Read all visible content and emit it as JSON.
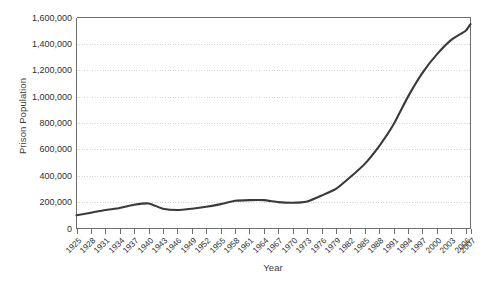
{
  "chart_data": {
    "type": "line",
    "title": "",
    "xlabel": "Year",
    "ylabel": "Prison Population",
    "xlim": [
      1925,
      2007
    ],
    "ylim": [
      0,
      1600000
    ],
    "grid": true,
    "legend": false,
    "legend_position": "none",
    "line_color": "#3a3a3a",
    "grid_color": "#c9c9c9",
    "axis_color": "#6e6e6e",
    "ytick_labels": [
      "0",
      "200,000",
      "400,000",
      "600,000",
      "800,000",
      "1,000,000",
      "1,200,000",
      "1,400,000",
      "1,600,000"
    ],
    "ytick_values": [
      0,
      200000,
      400000,
      600000,
      800000,
      1000000,
      1200000,
      1400000,
      1600000
    ],
    "xtick_labels": [
      "1925",
      "1928",
      "1931",
      "1934",
      "1937",
      "1940",
      "1943",
      "1946",
      "1949",
      "1952",
      "1955",
      "1958",
      "1961",
      "1964",
      "1967",
      "1970",
      "1973",
      "1976",
      "1979",
      "1982",
      "1985",
      "1988",
      "1991",
      "1994",
      "1997",
      "2000",
      "2003",
      "2006",
      "2007"
    ],
    "xtick_values": [
      1925,
      1928,
      1931,
      1934,
      1937,
      1940,
      1943,
      1946,
      1949,
      1952,
      1955,
      1958,
      1961,
      1964,
      1967,
      1970,
      1973,
      1976,
      1979,
      1982,
      1985,
      1988,
      1991,
      1994,
      1997,
      2000,
      2003,
      2006,
      2007
    ],
    "x": [
      1925,
      1928,
      1931,
      1934,
      1937,
      1940,
      1943,
      1946,
      1949,
      1952,
      1955,
      1958,
      1961,
      1964,
      1967,
      1970,
      1973,
      1976,
      1979,
      1982,
      1985,
      1988,
      1991,
      1994,
      1997,
      2000,
      2003,
      2006,
      2007
    ],
    "values": [
      100000,
      120000,
      140000,
      155000,
      180000,
      190000,
      150000,
      140000,
      150000,
      165000,
      185000,
      210000,
      215000,
      215000,
      200000,
      195000,
      205000,
      250000,
      300000,
      390000,
      490000,
      625000,
      790000,
      1000000,
      1180000,
      1320000,
      1430000,
      1500000,
      1550000
    ],
    "series": [
      {
        "name": "Prison Population",
        "values": [
          100000,
          120000,
          140000,
          155000,
          180000,
          190000,
          150000,
          140000,
          150000,
          165000,
          185000,
          210000,
          215000,
          215000,
          200000,
          195000,
          205000,
          250000,
          300000,
          390000,
          490000,
          625000,
          790000,
          1000000,
          1180000,
          1320000,
          1430000,
          1500000,
          1550000
        ]
      }
    ]
  }
}
